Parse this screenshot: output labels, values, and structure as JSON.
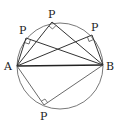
{
  "diagram": {
    "labels": {
      "A": "A",
      "B": "B",
      "P1": "P",
      "P2": "P",
      "P3": "P",
      "P4": "P"
    },
    "circle": {
      "cx": 60,
      "cy": 66,
      "r": 43
    },
    "points": {
      "A": [
        17,
        66
      ],
      "B": [
        103,
        65
      ],
      "P1": [
        26,
        38
      ],
      "P2": [
        52,
        22
      ],
      "P3": [
        92,
        35
      ],
      "P4": [
        44,
        105
      ]
    },
    "stroke_color": "#333333"
  }
}
